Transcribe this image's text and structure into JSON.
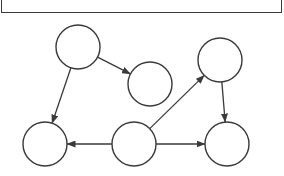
{
  "diagram": {
    "type": "directed-graph",
    "colors": {
      "stroke": "#3a3a3a",
      "background": "#ffffff",
      "node_fill": "#ffffff"
    },
    "top_box": {
      "label": ""
    },
    "nodes": [
      {
        "id": "n1",
        "label": "",
        "cx": 78,
        "cy": 47,
        "r": 22
      },
      {
        "id": "n2",
        "label": "",
        "cx": 150,
        "cy": 84,
        "r": 22
      },
      {
        "id": "n3",
        "label": "",
        "cx": 220,
        "cy": 60,
        "r": 22
      },
      {
        "id": "n4",
        "label": "",
        "cx": 45,
        "cy": 144,
        "r": 22
      },
      {
        "id": "n5",
        "label": "",
        "cx": 134,
        "cy": 144,
        "r": 22
      },
      {
        "id": "n6",
        "label": "",
        "cx": 227,
        "cy": 144,
        "r": 22
      }
    ],
    "edges": [
      {
        "from": "n1",
        "to": "n2"
      },
      {
        "from": "n1",
        "to": "n4"
      },
      {
        "from": "n5",
        "to": "n3"
      },
      {
        "from": "n3",
        "to": "n6"
      },
      {
        "from": "n5",
        "to": "n4"
      },
      {
        "from": "n5",
        "to": "n6"
      }
    ]
  }
}
